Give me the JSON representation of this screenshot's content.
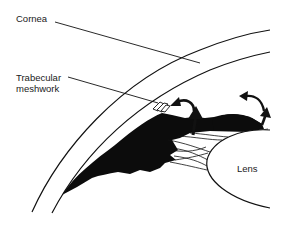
{
  "diagram": {
    "type": "anatomical-line-drawing",
    "labels": {
      "cornea": "Cornea",
      "trabecular_line1": "Trabecular",
      "trabecular_line2": "meshwork",
      "lens": "Lens"
    },
    "colors": {
      "ink": "#111111",
      "background": "#ffffff"
    },
    "arrows": [
      {
        "name": "flow-arrow-curved-left",
        "direction": "curving toward trabecular meshwork"
      },
      {
        "name": "flow-arrow-up-center",
        "direction": "up"
      },
      {
        "name": "flow-arrow-curved-right",
        "direction": "curving left"
      },
      {
        "name": "flow-arrow-up-right",
        "direction": "up"
      }
    ]
  }
}
